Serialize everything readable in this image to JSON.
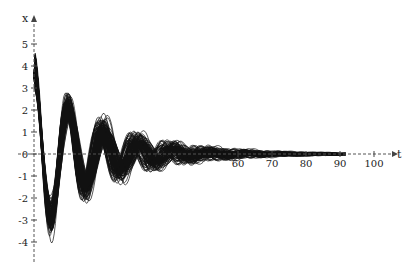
{
  "chart_data": {
    "type": "line",
    "title": "",
    "xlabel": "t",
    "ylabel": "x",
    "xlim": [
      0,
      108
    ],
    "ylim": [
      -4.8,
      5.6
    ],
    "x_ticks": [
      60,
      70,
      80,
      90,
      100
    ],
    "x_tick_labels": [
      "60",
      "70",
      "80",
      "90",
      "100"
    ],
    "y_ticks": [
      5,
      4,
      3,
      2,
      1,
      0,
      -1,
      -2,
      -3,
      -4
    ],
    "y_tick_labels": [
      "5",
      "4",
      "3",
      "2",
      "1",
      "0",
      "-1",
      "-2",
      "-3",
      "-4"
    ],
    "grid": false,
    "legend": null,
    "series_summary": {
      "count": 100,
      "initial_value": 3.5,
      "first_min_approx": {
        "t": 5,
        "x": -4.7
      },
      "max_peak_approx": {
        "t": 9,
        "x": 5.3
      },
      "decay_to_zero_t": 90
    },
    "line_color": "#111111"
  },
  "axes": {
    "origin_px": {
      "x": 34,
      "y": 154
    },
    "px_per_t": 3.4,
    "px_per_x": 22
  }
}
